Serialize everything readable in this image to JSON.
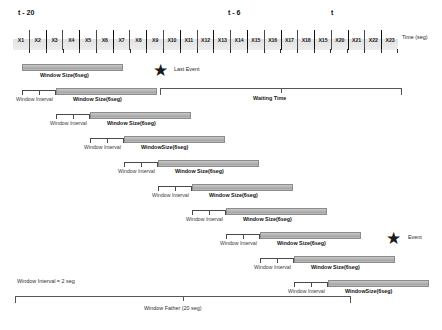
{
  "figure": {
    "axis_label": "Time (seg)",
    "time_markers": [
      {
        "label": "t - 20",
        "left": 18,
        "top": 9
      },
      {
        "label": "t - 6",
        "left": 228,
        "top": 9
      },
      {
        "label": "t",
        "left": 331,
        "top": 9
      }
    ],
    "cells": [
      "X1",
      "X2",
      "X3",
      "X4",
      "X5",
      "X6",
      "X7",
      "X8",
      "X9",
      "X10",
      "X11",
      "X12",
      "X13",
      "X14",
      "X15",
      "X16",
      "X17",
      "X18",
      "X15",
      "X20",
      "X21",
      "X22",
      "X23"
    ],
    "window_rows": [
      {
        "bar_left": 22,
        "bar_width": 101,
        "bar_top": 64,
        "label": "Window Size(6seg)",
        "label_left": 40,
        "label_top": 72,
        "interval": null
      },
      {
        "bar_left": 56,
        "bar_width": 101,
        "bar_top": 88,
        "label": "Window Size(6seg)",
        "label_left": 73,
        "label_top": 96,
        "interval": {
          "left": 22,
          "width": 34,
          "top": 90,
          "label": "Window Interval",
          "label_left": 16,
          "label_top": 96
        }
      },
      {
        "bar_left": 90,
        "bar_width": 101,
        "bar_top": 112,
        "label": "Window Size(6seg)",
        "label_left": 107,
        "label_top": 120,
        "interval": {
          "left": 56,
          "width": 34,
          "top": 114,
          "label": "Window Interval",
          "label_left": 50,
          "label_top": 120
        }
      },
      {
        "bar_left": 124,
        "bar_width": 101,
        "bar_top": 136,
        "label": "WindowSize(6seg)",
        "label_left": 141,
        "label_top": 144,
        "interval": {
          "left": 90,
          "width": 34,
          "top": 138,
          "label": "Window Interval",
          "label_left": 84,
          "label_top": 144
        }
      },
      {
        "bar_left": 158,
        "bar_width": 101,
        "bar_top": 160,
        "label": "Window Size(6seg)",
        "label_left": 175,
        "label_top": 168,
        "interval": {
          "left": 124,
          "width": 34,
          "top": 162,
          "label": "Window Interval",
          "label_left": 118,
          "label_top": 168
        }
      },
      {
        "bar_left": 192,
        "bar_width": 101,
        "bar_top": 184,
        "label": "Window Size(6seg)",
        "label_left": 209,
        "label_top": 192,
        "interval": {
          "left": 158,
          "width": 34,
          "top": 186,
          "label": "Window Interval",
          "label_left": 152,
          "label_top": 192
        }
      },
      {
        "bar_left": 226,
        "bar_width": 101,
        "bar_top": 208,
        "label": "Window Size(6seg)",
        "label_left": 243,
        "label_top": 216,
        "interval": {
          "left": 192,
          "width": 34,
          "top": 210,
          "label": "Window Interval",
          "label_left": 186,
          "label_top": 216
        }
      },
      {
        "bar_left": 260,
        "bar_width": 101,
        "bar_top": 232,
        "label": "Window Size(6seg)",
        "label_left": 277,
        "label_top": 240,
        "interval": {
          "left": 226,
          "width": 34,
          "top": 234,
          "label": "Window Interval",
          "label_left": 220,
          "label_top": 240
        }
      },
      {
        "bar_left": 294,
        "bar_width": 101,
        "bar_top": 256,
        "label": "Window Size(6seg)",
        "label_left": 311,
        "label_top": 264,
        "interval": {
          "left": 260,
          "width": 34,
          "top": 258,
          "label": "Window Interval",
          "label_left": 254,
          "label_top": 264
        }
      },
      {
        "bar_left": 328,
        "bar_width": 101,
        "bar_top": 280,
        "label": "WindowSize(6seg)",
        "label_left": 345,
        "label_top": 288,
        "interval": {
          "left": 294,
          "width": 34,
          "top": 282,
          "label": "Window Interval",
          "label_left": 288,
          "label_top": 288
        }
      }
    ],
    "stars": [
      {
        "name": "last-event",
        "label": "Last Event",
        "star_left": 153,
        "star_top": 62,
        "label_left": 174,
        "label_top": 66
      },
      {
        "name": "event",
        "label": "Event",
        "star_left": 386,
        "star_top": 230,
        "label_left": 408,
        "label_top": 234
      }
    ],
    "waiting_time": {
      "label": "Waiting Time",
      "left": 160,
      "width": 242,
      "top": 88,
      "label_left": 253,
      "label_top": 95
    },
    "window_father": {
      "label": "Window Father (20 seg)",
      "left": 15,
      "width": 336,
      "top": 296,
      "label_left": 144,
      "label_top": 305
    },
    "window_interval_note": {
      "label": "Window Interval = 2 seg",
      "left": 17,
      "top": 278
    }
  }
}
